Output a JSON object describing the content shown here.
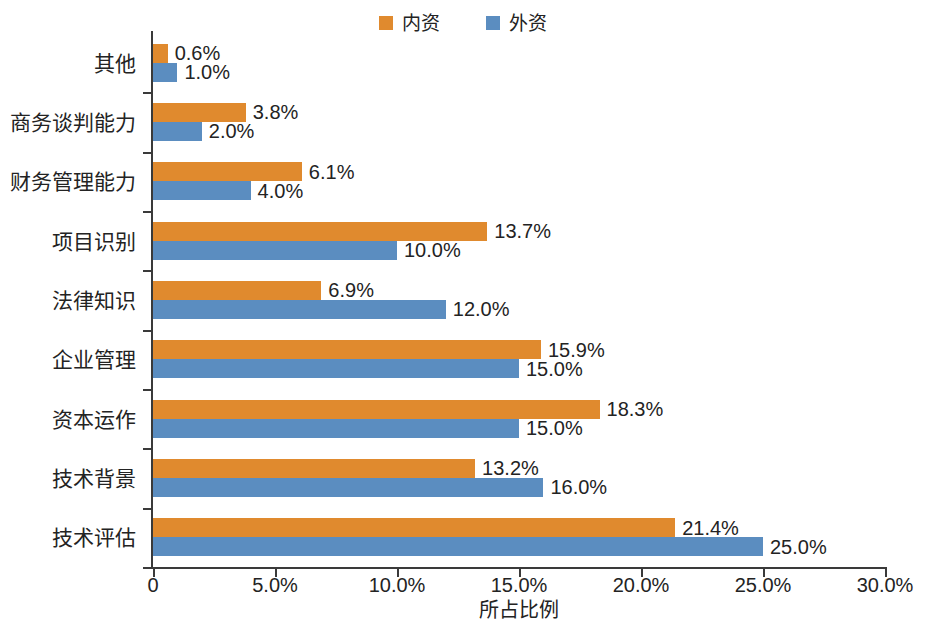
{
  "chart_data": {
    "type": "bar",
    "orientation": "horizontal",
    "title": "",
    "xlabel": "所占比例",
    "ylabel": "",
    "xlim": [
      0,
      30
    ],
    "xticks": [
      "0",
      "5.0%",
      "10.0%",
      "15.0%",
      "20.0%",
      "25.0%",
      "30.0%"
    ],
    "xtick_values": [
      0,
      5,
      10,
      15,
      20,
      25,
      30
    ],
    "grid": false,
    "legend_position": "top-center",
    "categories": [
      "其他",
      "商务谈判能力",
      "财务管理能力",
      "项目识别",
      "法律知识",
      "企业管理",
      "资本运作",
      "技术背景",
      "技术评估"
    ],
    "series": [
      {
        "name": "内资",
        "color": "#E08A2E",
        "values": [
          0.6,
          3.8,
          6.1,
          13.7,
          6.9,
          15.9,
          18.3,
          13.2,
          21.4
        ],
        "labels": [
          "0.6%",
          "3.8%",
          "6.1%",
          "13.7%",
          "6.9%",
          "15.9%",
          "18.3%",
          "13.2%",
          "21.4%"
        ]
      },
      {
        "name": "外资",
        "color": "#5B8DC0",
        "values": [
          1.0,
          2.0,
          4.0,
          10.0,
          12.0,
          15.0,
          15.0,
          16.0,
          25.0
        ],
        "labels": [
          "1.0%",
          "2.0%",
          "4.0%",
          "10.0%",
          "12.0%",
          "15.0%",
          "15.0%",
          "16.0%",
          "25.0%"
        ]
      }
    ]
  },
  "legend": {
    "entries": [
      {
        "label": "内资",
        "color": "#E08A2E"
      },
      {
        "label": "外资",
        "color": "#5B8DC0"
      }
    ]
  }
}
